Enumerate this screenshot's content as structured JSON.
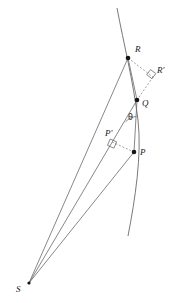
{
  "figure": {
    "type": "geometry-diagram",
    "width": 173,
    "height": 303,
    "background_color": "#ffffff",
    "stroke_color": "#5a5a5a",
    "dashed_stroke_color": "#7a7a7a",
    "point_color": "#141414",
    "text_color": "#1a1a1a"
  },
  "labels": {
    "R": "R",
    "R_prime": "R'",
    "Q": "Q",
    "P_prime": "P'",
    "P": "P",
    "S": "S",
    "theta": "θ"
  },
  "points": [
    {
      "name": "R",
      "label": "R",
      "x": 128,
      "y": 58,
      "label_x": 135,
      "label_y": 47,
      "marked": true
    },
    {
      "name": "R'",
      "label": "R'",
      "x": 152,
      "y": 76,
      "label_x": 157,
      "label_y": 68,
      "marked": false
    },
    {
      "name": "Q",
      "label": "Q",
      "x": 137,
      "y": 100,
      "label_x": 142,
      "label_y": 101,
      "marked": true
    },
    {
      "name": "P'",
      "label": "P'",
      "x": 112,
      "y": 142,
      "label_x": 107,
      "label_y": 131,
      "marked": false
    },
    {
      "name": "P",
      "label": "P",
      "x": 134,
      "y": 152,
      "label_x": 140,
      "label_y": 150,
      "marked": true
    },
    {
      "name": "S",
      "label": "S",
      "x": 29,
      "y": 283,
      "label_x": 17,
      "label_y": 287,
      "marked": true
    }
  ],
  "angle_marks": [
    {
      "name": "theta",
      "label": "θ",
      "label_x": 128,
      "label_y": 115,
      "vertex": "Q"
    },
    {
      "name": "right-angle-at-R-prime",
      "vertex": "R'"
    },
    {
      "name": "right-angle-at-P-prime",
      "vertex": "P'"
    }
  ],
  "segments": [
    {
      "name": "curve-orbit-arc",
      "style": "solid",
      "from": "top",
      "to": "bottom"
    },
    {
      "name": "radius-S-to-R",
      "style": "solid",
      "from": "S",
      "to": "R"
    },
    {
      "name": "radius-S-to-Q",
      "style": "solid",
      "from": "S",
      "to": "Q"
    },
    {
      "name": "radius-S-to-P",
      "style": "solid",
      "from": "S",
      "to": "P"
    },
    {
      "name": "chord-R-to-Q",
      "style": "solid",
      "from": "R",
      "to": "Q"
    },
    {
      "name": "chord-Q-to-P",
      "style": "solid",
      "from": "Q",
      "to": "P"
    },
    {
      "name": "dashed-R-to-R-prime",
      "style": "dashed",
      "from": "R",
      "to": "R'"
    },
    {
      "name": "dashed-R-prime-to-Q",
      "style": "dashed",
      "from": "R'",
      "to": "Q"
    },
    {
      "name": "dashed-P-prime-to-P",
      "style": "dashed",
      "from": "P'",
      "to": "P"
    }
  ]
}
